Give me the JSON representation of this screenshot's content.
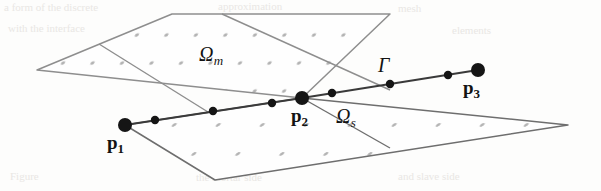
{
  "figure": {
    "kind": "geometry-diagram",
    "background_color": "#fdfdfc",
    "mesh_line_color_upper": "#8e8e8e",
    "mesh_line_color_lower": "#6e6e6e",
    "interface_line_color": "#3a3a3a",
    "node_color": "#151515",
    "grid_dot_color": "#b5b5b5"
  },
  "labels": {
    "p1": {
      "base": "p",
      "sub": "1"
    },
    "p2": {
      "base": "p",
      "sub": "2"
    },
    "p3": {
      "base": "p",
      "sub": "3"
    },
    "omega_m": {
      "base": "Ω",
      "sub": "m"
    },
    "omega_s": {
      "base": "Ω",
      "sub": "s"
    },
    "gamma": {
      "base": "Γ"
    }
  },
  "geometry": {
    "upper_domain_quad": [
      [
        37,
        70
      ],
      [
        172,
        14
      ],
      [
        390,
        14
      ],
      [
        302,
        98
      ]
    ],
    "lower_domain_quad": [
      [
        125,
        125
      ],
      [
        302,
        98
      ],
      [
        568,
        125
      ],
      [
        215,
        180
      ]
    ],
    "interface_polyline": [
      [
        125,
        125
      ],
      [
        302,
        98
      ],
      [
        478,
        70
      ]
    ],
    "upper_internal_lines": [
      [
        [
          99,
          44
        ],
        [
          232,
          127
        ]
      ],
      [
        [
          222,
          14
        ],
        [
          390,
          90
        ]
      ]
    ],
    "lower_internal_lines": [
      [
        [
          302,
          98
        ],
        [
          390,
          148
        ]
      ]
    ],
    "interface_major_nodes": [
      {
        "name": "p1",
        "x": 125,
        "y": 125,
        "r": 7.0
      },
      {
        "name": "p2",
        "x": 302,
        "y": 98,
        "r": 7.0
      },
      {
        "name": "p3",
        "x": 478,
        "y": 70,
        "r": 7.0
      }
    ],
    "interface_minor_nodes": [
      {
        "x": 155,
        "y": 120,
        "r": 4.2
      },
      {
        "x": 213,
        "y": 111,
        "r": 4.2
      },
      {
        "x": 272,
        "y": 103,
        "r": 4.2
      },
      {
        "x": 332,
        "y": 93,
        "r": 4.2
      },
      {
        "x": 390,
        "y": 84,
        "r": 4.2
      },
      {
        "x": 448,
        "y": 75,
        "r": 4.2
      }
    ]
  },
  "label_positions": {
    "p1": {
      "x": 107,
      "y": 133
    },
    "p2": {
      "x": 291,
      "y": 106
    },
    "p3": {
      "x": 463,
      "y": 78
    },
    "omega_m": {
      "x": 199,
      "y": 44
    },
    "omega_s": {
      "x": 336,
      "y": 106
    },
    "gamma": {
      "x": 378,
      "y": 55
    }
  },
  "bleed_text": [
    {
      "text": "a form of the discrete",
      "x": 4,
      "y": 1
    },
    {
      "text": "approximation",
      "x": 218,
      "y": 0
    },
    {
      "text": "mesh",
      "x": 398,
      "y": 2
    },
    {
      "text": "with the interface",
      "x": 8,
      "y": 22
    },
    {
      "text": "constraint",
      "x": 200,
      "y": 24
    },
    {
      "text": "of the",
      "x": 348,
      "y": 22
    },
    {
      "text": "elements",
      "x": 452,
      "y": 24
    },
    {
      "text": "Figure",
      "x": 10,
      "y": 170
    },
    {
      "text": "the mortar side",
      "x": 196,
      "y": 171
    },
    {
      "text": "and slave side",
      "x": 398,
      "y": 170
    }
  ]
}
